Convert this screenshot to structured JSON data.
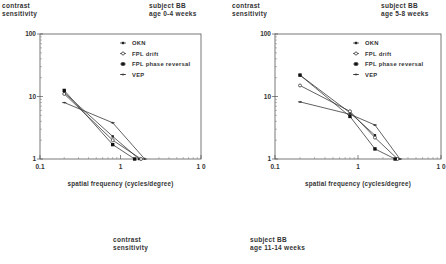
{
  "chart_data": [
    {
      "type": "line",
      "title": "subject BB age 0-4 weeks",
      "header_left": [
        "contrast",
        "sensitivity"
      ],
      "header_right": [
        "subject BB",
        "age 0-4 weeks"
      ],
      "xlabel": "spatial frequency (cycles/degree)",
      "ylabel": "contrast sensitivity",
      "xscale": "log",
      "yscale": "log",
      "xlim": [
        0.1,
        10
      ],
      "ylim": [
        1,
        100
      ],
      "x_ticks": [
        "0.1",
        "1",
        "1 0"
      ],
      "y_ticks": [
        "100",
        "10",
        "1"
      ],
      "legend_position": "upper right inside",
      "series": [
        {
          "name": "OKN",
          "marker": "filled-small",
          "x": [
            0.2,
            0.8,
            1.7
          ],
          "y": [
            11.5,
            2.3,
            1
          ]
        },
        {
          "name": "FPL drift",
          "marker": "open-circle",
          "x": [
            0.2,
            0.8,
            1.8
          ],
          "y": [
            11,
            2.0,
            1
          ]
        },
        {
          "name": "FPL phase reversal",
          "marker": "filled-square",
          "x": [
            0.2,
            0.8,
            1.5
          ],
          "y": [
            12.5,
            1.7,
            1
          ]
        },
        {
          "name": "VEP",
          "marker": "cross",
          "x": [
            0.2,
            0.8,
            2.0
          ],
          "y": [
            8,
            3.8,
            1
          ]
        }
      ]
    },
    {
      "type": "line",
      "title": "subject BB age 5-8 weeks",
      "header_left": [
        "contrast",
        "sensitivity"
      ],
      "header_right": [
        "subject BB",
        "age 5-8 weeks"
      ],
      "xlabel": "spatial frequency (cycles/degree)",
      "ylabel": "contrast sensitivity",
      "xscale": "log",
      "yscale": "log",
      "xlim": [
        0.1,
        10
      ],
      "ylim": [
        1,
        100
      ],
      "x_ticks": [
        "0.1",
        "1",
        "1 0"
      ],
      "y_ticks": [
        "100",
        "10",
        "1"
      ],
      "legend_position": "upper right inside",
      "series": [
        {
          "name": "OKN",
          "marker": "filled-small",
          "x": [
            0.2,
            0.8,
            1.6
          ],
          "y": [
            22,
            5.5,
            2.4
          ]
        },
        {
          "name": "FPL drift",
          "marker": "open-circle",
          "x": [
            0.2,
            0.8,
            1.6,
            3.0
          ],
          "y": [
            15,
            5.8,
            2.2,
            1
          ]
        },
        {
          "name": "FPL phase reversal",
          "marker": "filled-square",
          "x": [
            0.2,
            0.8,
            1.6,
            2.8
          ],
          "y": [
            22,
            4.8,
            1.45,
            1
          ]
        },
        {
          "name": "VEP",
          "marker": "cross",
          "x": [
            0.2,
            0.8,
            1.6,
            3.2
          ],
          "y": [
            8.2,
            5.2,
            3.5,
            1
          ]
        }
      ]
    },
    {
      "type": "line",
      "title": "subject BB age 11-14 weeks",
      "header_left": [
        "contrast",
        "sensitivity"
      ],
      "header_right": [
        "subject BB",
        "age 11-14 weeks"
      ],
      "series": []
    }
  ]
}
